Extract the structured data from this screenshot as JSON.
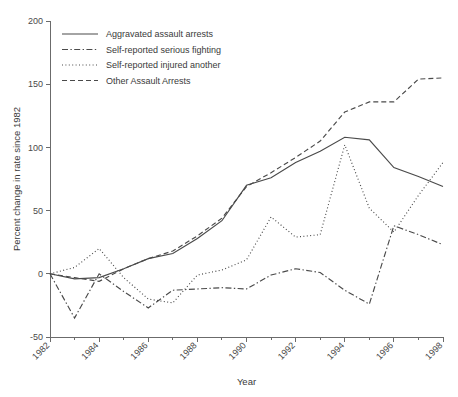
{
  "chart_data": {
    "type": "line",
    "title": "",
    "xlabel": "Year",
    "ylabel": "Percent change in rate since 1982",
    "xlim": [
      1982,
      1998
    ],
    "ylim": [
      -50,
      200
    ],
    "yticks": [
      -50,
      0,
      50,
      100,
      150,
      200
    ],
    "ytick_labels": [
      "-50",
      "0",
      "50",
      "100",
      "150",
      "200"
    ],
    "xticks": [
      1982,
      1984,
      1986,
      1988,
      1990,
      1992,
      1994,
      1996,
      1998
    ],
    "xtick_labels": [
      "1982",
      "1984",
      "1986",
      "1988",
      "1990",
      "1992",
      "1994",
      "1996",
      "1998"
    ],
    "xminor_ticks": [
      1983,
      1985,
      1987,
      1989,
      1991,
      1993,
      1995,
      1997
    ],
    "grid": false,
    "legend_position": "top-left",
    "x": [
      1982,
      1983,
      1984,
      1985,
      1986,
      1987,
      1988,
      1989,
      1990,
      1991,
      1992,
      1993,
      1994,
      1995,
      1996,
      1997,
      1998
    ],
    "series": [
      {
        "name": "Aggravated assault arrests",
        "dash": "none",
        "color": "#4a4a4a",
        "values": [
          0,
          -4,
          -3,
          4,
          12,
          16,
          28,
          42,
          70,
          76,
          88,
          97,
          108,
          106,
          84,
          77,
          69
        ]
      },
      {
        "name": "Self-reported serious fighting",
        "dash": "dashdot",
        "color": "#4a4a4a",
        "values": [
          0,
          -35,
          0,
          -14,
          -27,
          -13,
          -12,
          -11,
          -12,
          -1,
          4,
          1,
          -13,
          -24,
          38,
          31,
          23
        ]
      },
      {
        "name": "Self-reported injured another",
        "dash": "dotted",
        "color": "#4a4a4a",
        "values": [
          0,
          5,
          20,
          -3,
          -20,
          -23,
          -1,
          3,
          11,
          45,
          29,
          31,
          102,
          52,
          33,
          62,
          88
        ]
      },
      {
        "name": "Other Assault Arrests",
        "dash": "dashed",
        "color": "#4a4a4a",
        "values": [
          0,
          -3,
          -6,
          4,
          12,
          18,
          30,
          44,
          69,
          80,
          92,
          105,
          128,
          136,
          136,
          154,
          155
        ]
      }
    ]
  },
  "legend": {
    "entries": [
      {
        "label": "Aggravated assault arrests"
      },
      {
        "label": "Self-reported serious fighting"
      },
      {
        "label": "Self-reported injured another"
      },
      {
        "label": "Other Assault Arrests"
      }
    ]
  }
}
